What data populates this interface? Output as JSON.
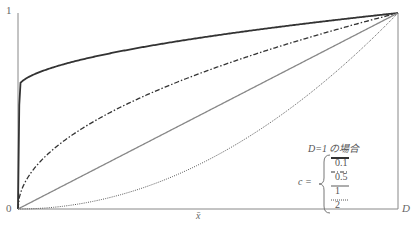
{
  "chart_data": {
    "type": "line",
    "title": "",
    "xlabel": "x̄",
    "ylabel": "",
    "x_ticks": [
      "0",
      "D"
    ],
    "y_ticks": [
      "0",
      "1"
    ],
    "xlim": [
      0,
      1
    ],
    "ylim": [
      0,
      1
    ],
    "grid": false,
    "legend_position": "lower right",
    "legend_title": "D=1 の場合",
    "legend_param": "c =",
    "x": [
      0,
      0.05,
      0.1,
      0.2,
      0.3,
      0.4,
      0.5,
      0.6,
      0.7,
      0.8,
      0.9,
      1.0
    ],
    "series": [
      {
        "name": "0.1",
        "style": "solid-thick",
        "values": [
          0,
          0.74,
          0.79,
          0.85,
          0.89,
          0.91,
          0.93,
          0.95,
          0.96,
          0.98,
          0.99,
          1.0
        ]
      },
      {
        "name": "0.5",
        "style": "dash-dot",
        "values": [
          0,
          0.22,
          0.32,
          0.45,
          0.55,
          0.63,
          0.71,
          0.77,
          0.84,
          0.89,
          0.95,
          1.0
        ]
      },
      {
        "name": "1",
        "style": "solid-gray",
        "values": [
          0,
          0.05,
          0.1,
          0.2,
          0.3,
          0.4,
          0.5,
          0.6,
          0.7,
          0.8,
          0.9,
          1.0
        ]
      },
      {
        "name": "2",
        "style": "dotted",
        "values": [
          0,
          0.0025,
          0.01,
          0.04,
          0.09,
          0.16,
          0.25,
          0.36,
          0.49,
          0.64,
          0.81,
          1.0
        ]
      }
    ]
  },
  "axes": {
    "origin_label": "0",
    "y_top_label": "1",
    "x_end_label": "D",
    "x_label": "x̄"
  },
  "legend": {
    "title": "D=1 の場合",
    "param": "c =",
    "items": [
      {
        "label": "0.1"
      },
      {
        "label": "0.5"
      },
      {
        "label": "1"
      },
      {
        "label": "2"
      }
    ]
  }
}
